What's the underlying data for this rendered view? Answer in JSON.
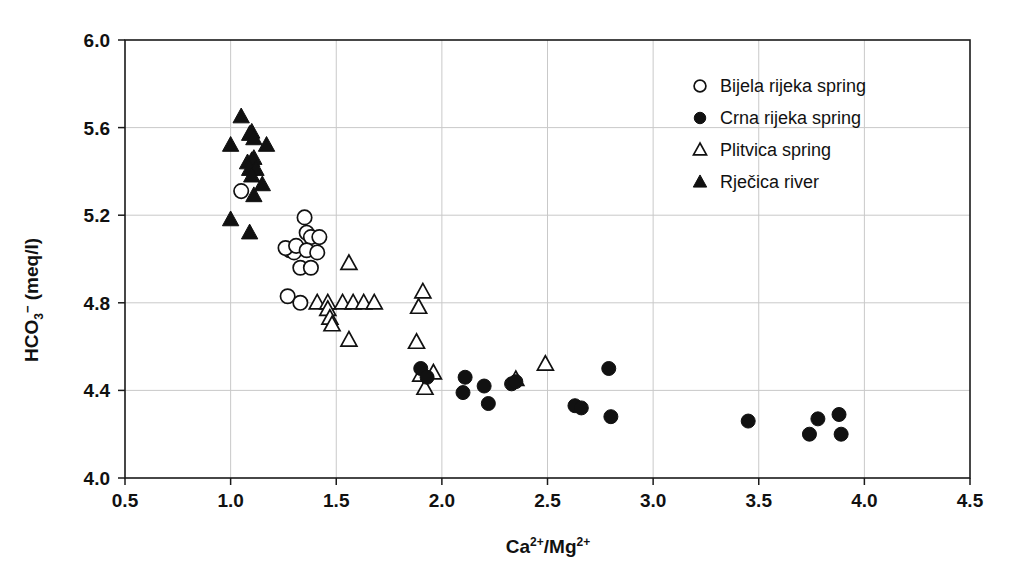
{
  "chart_data": {
    "type": "scatter",
    "title": "",
    "xlabel": "Ca2+/Mg2+",
    "ylabel": "HCO3- (meq/l)",
    "xlim": [
      0.5,
      4.5
    ],
    "ylim": [
      4.0,
      6.0
    ],
    "xticks": [
      "0.5",
      "1.0",
      "1.5",
      "2.0",
      "2.5",
      "3.0",
      "3.5",
      "4.0",
      "4.5"
    ],
    "xtick_values": [
      0.5,
      1.0,
      1.5,
      2.0,
      2.5,
      3.0,
      3.5,
      4.0,
      4.5
    ],
    "yticks": [
      "4.0",
      "4.4",
      "4.8",
      "5.2",
      "5.6",
      "6.0"
    ],
    "ytick_values": [
      4.0,
      4.4,
      4.8,
      5.2,
      5.6,
      6.0
    ],
    "grid": true,
    "legend_position": "top-right",
    "series": [
      {
        "name": "Bijela rijeka spring",
        "marker": "open-circle",
        "color": "#111111",
        "points": [
          [
            1.05,
            5.31
          ],
          [
            1.27,
            4.83
          ],
          [
            1.33,
            4.8
          ],
          [
            1.28,
            5.04
          ],
          [
            1.3,
            5.03
          ],
          [
            1.26,
            5.05
          ],
          [
            1.31,
            5.06
          ],
          [
            1.35,
            5.19
          ],
          [
            1.36,
            5.12
          ],
          [
            1.38,
            5.1
          ],
          [
            1.42,
            5.1
          ],
          [
            1.36,
            5.04
          ],
          [
            1.33,
            4.96
          ],
          [
            1.38,
            4.96
          ],
          [
            1.41,
            5.03
          ]
        ]
      },
      {
        "name": "Crna rijeka spring",
        "marker": "filled-circle",
        "color": "#111111",
        "points": [
          [
            1.9,
            4.5
          ],
          [
            1.93,
            4.46
          ],
          [
            2.11,
            4.46
          ],
          [
            2.1,
            4.39
          ],
          [
            2.2,
            4.42
          ],
          [
            2.22,
            4.34
          ],
          [
            2.33,
            4.43
          ],
          [
            2.35,
            4.44
          ],
          [
            2.63,
            4.33
          ],
          [
            2.66,
            4.32
          ],
          [
            2.79,
            4.5
          ],
          [
            2.8,
            4.28
          ],
          [
            3.45,
            4.26
          ],
          [
            3.74,
            4.2
          ],
          [
            3.78,
            4.27
          ],
          [
            3.88,
            4.29
          ],
          [
            3.89,
            4.2
          ]
        ]
      },
      {
        "name": "Plitvica spring",
        "marker": "open-triangle",
        "color": "#111111",
        "points": [
          [
            1.41,
            4.8
          ],
          [
            1.46,
            4.8
          ],
          [
            1.46,
            4.77
          ],
          [
            1.47,
            4.73
          ],
          [
            1.48,
            4.7
          ],
          [
            1.53,
            4.8
          ],
          [
            1.58,
            4.8
          ],
          [
            1.63,
            4.8
          ],
          [
            1.68,
            4.8
          ],
          [
            1.56,
            4.98
          ],
          [
            1.56,
            4.63
          ],
          [
            1.91,
            4.85
          ],
          [
            1.89,
            4.78
          ],
          [
            1.88,
            4.62
          ],
          [
            1.9,
            4.47
          ],
          [
            1.92,
            4.41
          ],
          [
            1.96,
            4.48
          ],
          [
            2.35,
            4.45
          ],
          [
            2.49,
            4.52
          ]
        ]
      },
      {
        "name": "Rječica river",
        "marker": "filled-triangle",
        "color": "#111111",
        "points": [
          [
            1.05,
            5.65
          ],
          [
            1.0,
            5.52
          ],
          [
            1.09,
            5.57
          ],
          [
            1.1,
            5.58
          ],
          [
            1.11,
            5.55
          ],
          [
            1.17,
            5.52
          ],
          [
            1.08,
            5.44
          ],
          [
            1.1,
            5.45
          ],
          [
            1.11,
            5.46
          ],
          [
            1.09,
            5.41
          ],
          [
            1.12,
            5.41
          ],
          [
            1.1,
            5.38
          ],
          [
            1.15,
            5.34
          ],
          [
            1.11,
            5.29
          ],
          [
            1.0,
            5.18
          ],
          [
            1.09,
            5.12
          ]
        ]
      }
    ]
  },
  "axis": {
    "y_title_main": "HCO",
    "y_title_sub": "3",
    "y_title_sup": "−",
    "y_title_unit": " (meq/l)",
    "x_title_ca": "Ca",
    "x_title_ca_sup": "2+",
    "x_title_slash": "/Mg",
    "x_title_mg_sup": "2+"
  },
  "legend": {
    "items": [
      {
        "label": "Bijela rijeka spring",
        "marker": "open-circle"
      },
      {
        "label": "Crna rijeka spring",
        "marker": "filled-circle"
      },
      {
        "label": "Plitvica spring",
        "marker": "open-triangle"
      },
      {
        "label": "Rječica river",
        "marker": "filled-triangle"
      }
    ]
  },
  "colors": {
    "ink": "#111111",
    "grid": "#c9c9c9",
    "background": "#ffffff"
  }
}
